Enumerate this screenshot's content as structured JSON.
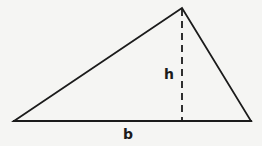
{
  "figure": {
    "name": "triangle-area-diagram",
    "background_color": "#f5f5f3",
    "stroke_color": "#1b1b1b",
    "canvas": {
      "width": 262,
      "height": 146
    },
    "vertices": {
      "left": {
        "x": 14,
        "y": 121
      },
      "apex": {
        "x": 182,
        "y": 8
      },
      "right": {
        "x": 251,
        "y": 121
      }
    },
    "altitude": {
      "from": {
        "x": 182,
        "y": 8
      },
      "to": {
        "x": 182,
        "y": 121
      },
      "style": "dashed",
      "dash_pattern": "7 5"
    },
    "labels": {
      "height": "h",
      "base": "b"
    }
  }
}
